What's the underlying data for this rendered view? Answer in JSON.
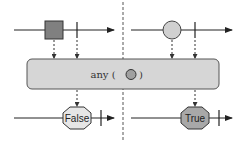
{
  "diagram": {
    "type": "marble-diagram",
    "operator": {
      "label_prefix": "any ( ",
      "label_suffix": " )",
      "predicate_icon": "circle-marble-icon"
    },
    "left_panel": {
      "input_marble": "square-marble",
      "input_color": "#808080",
      "output_label": "False",
      "output_color": "#e6e6e6"
    },
    "right_panel": {
      "input_marble": "circle-marble",
      "input_color": "#d0d0d0",
      "output_label": "True",
      "output_color": "#a8a8a8"
    },
    "colors": {
      "line": "#222222",
      "operator_box_fill": "#d6d6d6",
      "operator_box_stroke": "#555555",
      "divider": "#555555"
    }
  }
}
